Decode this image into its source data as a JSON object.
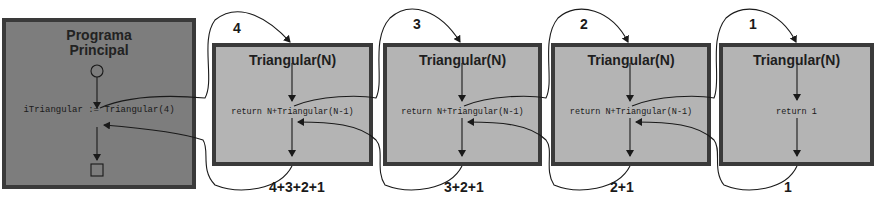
{
  "diagram": {
    "main": {
      "title_line1": "Programa",
      "title_line2": "Principal",
      "code": "iTriangular := Triangular(4)"
    },
    "calls": [
      {
        "title": "Triangular(N)",
        "code": "return N+Triangular(N-1)",
        "arg": "4",
        "result": "4+3+2+1"
      },
      {
        "title": "Triangular(N)",
        "code": "return N+Triangular(N-1)",
        "arg": "3",
        "result": "3+2+1"
      },
      {
        "title": "Triangular(N)",
        "code": "return N+Triangular(N-1)",
        "arg": "2",
        "result": "2+1"
      },
      {
        "title": "Triangular(N)",
        "code": "return 1",
        "arg": "1",
        "result": "1"
      }
    ],
    "colors": {
      "main_fill": "#7d7d7d",
      "call_fill": "#b4b4b4",
      "border": "#3a3a3a",
      "line": "#1a1a1a"
    }
  }
}
